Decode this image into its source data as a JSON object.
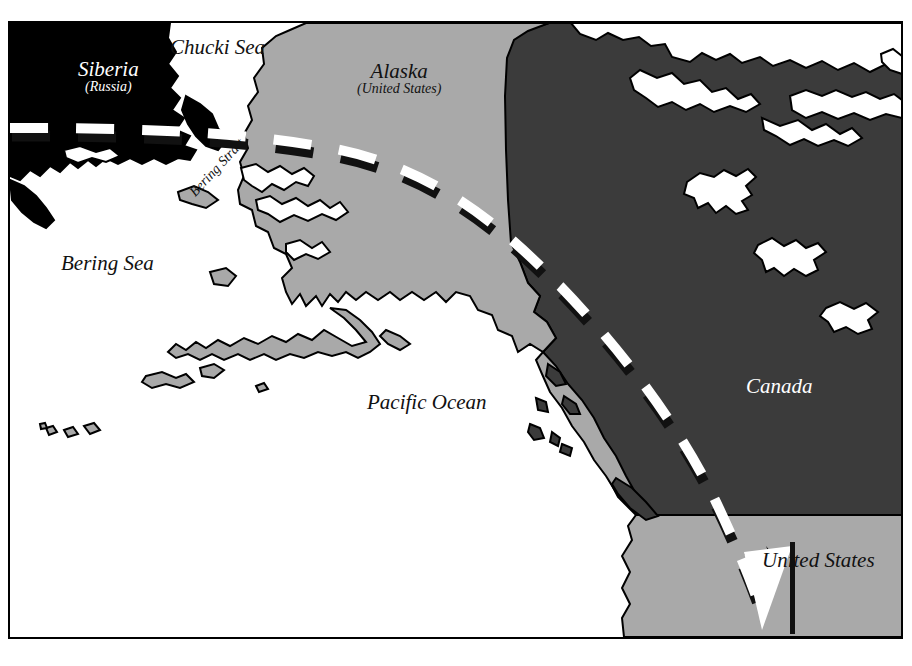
{
  "map": {
    "title": "Alaska and the Bering Strait region map",
    "frame": {
      "border_color": "#000000",
      "border_width_px": 2,
      "background_color": "#ffffff"
    },
    "colors": {
      "ocean": "#ffffff",
      "siberia_fill": "#000000",
      "alaska_fill": "#a9a9a9",
      "canada_fill": "#3b3b3b",
      "united_states_fill": "#a9a9a9",
      "coastline": "#000000",
      "dashed_line": "#ffffff",
      "dashed_line_edge": "#000000",
      "label_dark": "#111111",
      "label_light": "#ffffff"
    },
    "labels": [
      {
        "name": "siberia",
        "text": "Siberia",
        "sub": "(Russia)",
        "style": "light",
        "x": 78,
        "y": 58
      },
      {
        "name": "chucki-sea",
        "text": "Chucki Sea",
        "sub": "",
        "style": "dark",
        "x": 170,
        "y": 36
      },
      {
        "name": "alaska",
        "text": "Alaska",
        "sub": "(United States)",
        "style": "dark",
        "x": 357,
        "y": 60
      },
      {
        "name": "bering-strait",
        "text": "Bering Strait",
        "sub": "",
        "style": "dark",
        "x": 198,
        "y": 185,
        "rotation_deg": -47
      },
      {
        "name": "bering-sea",
        "text": "Bering Sea",
        "sub": "",
        "style": "dark",
        "x": 61,
        "y": 252
      },
      {
        "name": "pacific-ocean",
        "text": "Pacific Ocean",
        "sub": "",
        "style": "dark",
        "x": 367,
        "y": 391
      },
      {
        "name": "canada",
        "text": "Canada",
        "sub": "",
        "style": "light",
        "x": 746,
        "y": 375
      },
      {
        "name": "united-states",
        "text": "United States",
        "sub": "",
        "style": "dark",
        "x": 762,
        "y": 549
      }
    ],
    "annotations": {
      "arrow_marker": "v-arrow-pointer",
      "dashed_boundary": "international-date-line-and-boundary"
    }
  }
}
